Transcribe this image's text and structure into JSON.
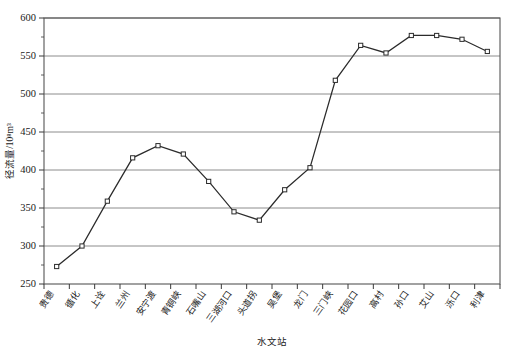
{
  "chart_data": {
    "type": "line",
    "title": "",
    "xlabel": "水文站",
    "ylabel": "径流量/10⁸m³",
    "ylim": [
      250,
      600
    ],
    "ytick_step": 50,
    "yminor_step": 25,
    "grid": true,
    "legend": "none",
    "categories": [
      "贵德",
      "循化",
      "上诠",
      "兰州",
      "安宁渡",
      "青铜峡",
      "石嘴山",
      "三湖河口",
      "头道拐",
      "吴堡",
      "龙门",
      "三门峡",
      "花园口",
      "高村",
      "孙口",
      "艾山",
      "泺口",
      "利津"
    ],
    "values": [
      273,
      300,
      359,
      416,
      432,
      421,
      385,
      345,
      334,
      374,
      403,
      518,
      564,
      554,
      577,
      577,
      572,
      556
    ],
    "yticks": [
      250,
      300,
      350,
      400,
      450,
      500,
      550,
      600
    ],
    "ytick_labels": [
      "250",
      "300",
      "350",
      "400",
      "450",
      "500",
      "550",
      "600"
    ],
    "marker": "open-square",
    "line_color": "#2b2b2b",
    "marker_fill": "#ffffff",
    "grid_color": "#808080"
  }
}
